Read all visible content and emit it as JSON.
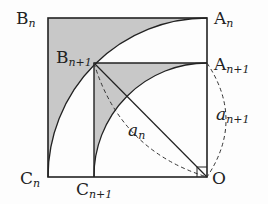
{
  "diagram": {
    "type": "geometry",
    "colors": {
      "shade": "#c8c8c8",
      "line": "#222222",
      "background": "#fdfdfd"
    },
    "points": {
      "Bn": {
        "label": "B",
        "sub": "n"
      },
      "An": {
        "label": "A",
        "sub": "n"
      },
      "Bn1": {
        "label": "B",
        "sub": "n+1"
      },
      "An1": {
        "label": "A",
        "sub": "n+1"
      },
      "Cn": {
        "label": "C",
        "sub": "n"
      },
      "Cn1": {
        "label": "C",
        "sub": "n+1"
      },
      "O": {
        "label": "O"
      }
    },
    "lengths": {
      "an": {
        "label": "a",
        "sub": "n"
      },
      "an1": {
        "label": "a",
        "sub": "n+1"
      }
    }
  }
}
